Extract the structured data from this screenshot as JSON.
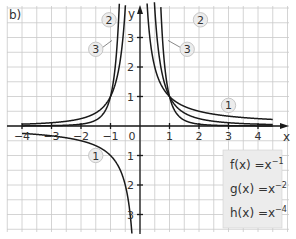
{
  "panel_label": "b)",
  "chart_data": {
    "type": "line",
    "title": "",
    "xlabel": "x",
    "ylabel": "y",
    "xlim": [
      -4.5,
      5
    ],
    "ylim": [
      -3.6,
      4.1
    ],
    "grid": true,
    "grid_step": 0.5,
    "x_ticks": [
      -4,
      -3,
      -2,
      -1,
      0,
      1,
      2,
      3,
      4
    ],
    "x_tick_labels": [
      "-4",
      "-3",
      "-2",
      "-1",
      "0",
      "1",
      "2",
      "3",
      "4"
    ],
    "y_ticks": [
      -3,
      -2,
      -1,
      1,
      2,
      3
    ],
    "y_tick_labels": [
      "3",
      "2",
      "1",
      "1",
      "2",
      "3"
    ],
    "origin_label": "0",
    "series": [
      {
        "id": "1",
        "name": "f(x) = x^-1",
        "exponent": -1,
        "label_positions": [
          {
            "x": 3,
            "y": 0.7
          },
          {
            "x": -1.5,
            "y": -1
          }
        ]
      },
      {
        "id": "2",
        "name": "g(x) = x^-2",
        "exponent": -2,
        "label_positions": [
          {
            "x": -1.05,
            "y": 3.6
          },
          {
            "x": 2.05,
            "y": 3.6
          }
        ]
      },
      {
        "id": "3",
        "name": "h(x) = x^-4",
        "exponent": -4,
        "label_positions": [
          {
            "x": -1.5,
            "y": 2.6
          },
          {
            "x": 1.6,
            "y": 2.6
          }
        ]
      }
    ],
    "legend": {
      "position": "lower right",
      "entries": [
        {
          "fn": "f(x)",
          "eq": "=x",
          "sup": "-1"
        },
        {
          "fn": "g(x)",
          "eq": "=x",
          "sup": "-2"
        },
        {
          "fn": "h(x)",
          "eq": "=x",
          "sup": "-4"
        }
      ]
    }
  },
  "colors": {
    "curve": "#1a1a1a",
    "grid": "#c9c9c9",
    "badge_fill": "#ececec",
    "legend_fill": "#ececec"
  }
}
